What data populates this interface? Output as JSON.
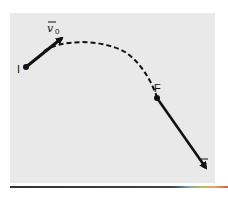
{
  "figure": {
    "points": {
      "initial": {
        "label": "I"
      },
      "final": {
        "label": "F"
      }
    },
    "vectors": {
      "initial_velocity": {
        "label": "v",
        "subscript": "0",
        "has_arrow_accent": true
      },
      "final_velocity": {
        "label": "v",
        "has_arrow_accent": true
      }
    },
    "path": {
      "style": "dashed",
      "shape": "parabolic arc"
    },
    "colors": {
      "panel": "#e9e9ea",
      "ink": "#111111",
      "rule": "#3a3a3a"
    }
  }
}
